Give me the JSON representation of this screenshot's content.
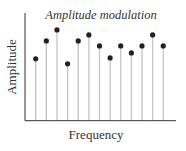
{
  "chart_data": {
    "type": "stem",
    "title": "Amplitude modulation",
    "xlabel": "Frequency",
    "ylabel": "Amplitude",
    "grid": false,
    "legend": null,
    "x": [
      1,
      2,
      3,
      4,
      5,
      6,
      7,
      8,
      9,
      10,
      11,
      12,
      13
    ],
    "values": [
      62,
      80,
      91,
      57,
      80,
      86,
      75,
      63,
      75,
      68,
      75,
      86,
      75
    ],
    "ylim": [
      0,
      108
    ],
    "colors": {
      "stem": "#c4c4c4",
      "marker": "#222222",
      "axis": "#333333"
    }
  }
}
